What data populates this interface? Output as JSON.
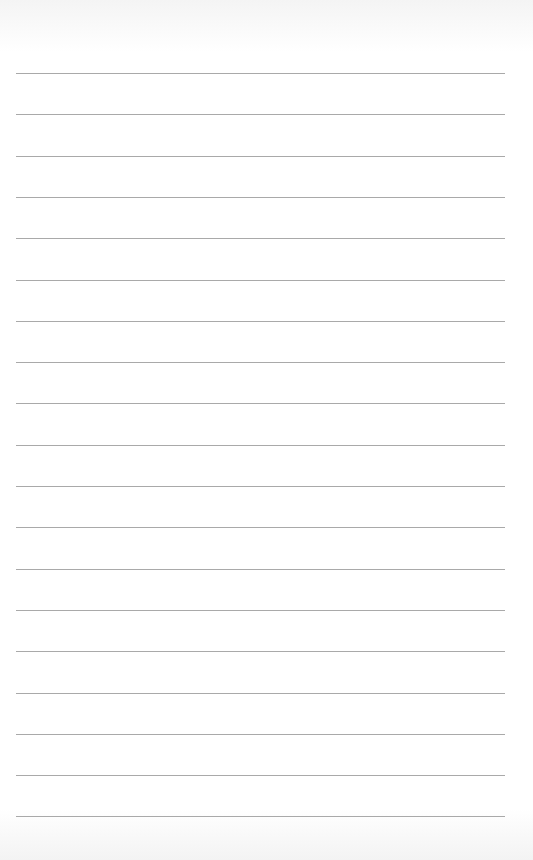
{
  "paper": {
    "type": "lined-paper",
    "background_color": "#ffffff",
    "line_color": "#a9a9a9",
    "line_count": 19,
    "first_line_y": 73,
    "line_spacing": 41.3,
    "line_left": 16,
    "line_width": 489
  }
}
